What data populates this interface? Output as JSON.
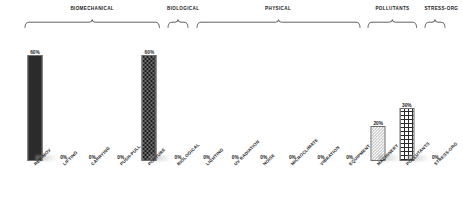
{
  "chart_data": {
    "type": "bar",
    "title": "",
    "subtitle": "",
    "xlabel": "",
    "ylabel": "",
    "ylim": [
      0,
      65
    ],
    "grid": false,
    "legend": "none",
    "value_suffix": "%",
    "categories": [
      "REP-MOV",
      "LIFTING",
      "CARRYING",
      "PUSH-PULL",
      "POSTURE",
      "BIOLOGICAL",
      "LIGHTING",
      "UV RADIATION",
      "NOISE",
      "MICROCLIMATE",
      "VIBRATION",
      "EQUIPMENT",
      "MACHINERY",
      "POLLUTANTS",
      "STRESS-ORG"
    ],
    "values": [
      60,
      0,
      0,
      0,
      60,
      0,
      0,
      0,
      0,
      0,
      0,
      0,
      20,
      30,
      0
    ],
    "value_labels": [
      "60%",
      "0%",
      "0%",
      "0%",
      "60%",
      "0%",
      "0%",
      "0%",
      "0%",
      "0%",
      "0%",
      "0%",
      "20%",
      "30%",
      "0%"
    ],
    "bar_patterns": [
      "solid",
      "none",
      "none",
      "none",
      "dots",
      "none",
      "none",
      "none",
      "none",
      "none",
      "none",
      "none",
      "checker",
      "cross",
      "none"
    ],
    "groups": [
      {
        "label": "BIOMECHANICAL",
        "start": 0,
        "end": 4
      },
      {
        "label": "BIOLOGICAL",
        "start": 5,
        "end": 5
      },
      {
        "label": "PHYSICAL",
        "start": 6,
        "end": 11
      },
      {
        "label": "POLLUTANTS",
        "start": 12,
        "end": 13
      },
      {
        "label": "STRESS-ORG",
        "start": 14,
        "end": 14
      }
    ],
    "colors": {
      "bar_solid": "#2b2b2b",
      "bar_dots": "#6d6d6d",
      "bar_checker": "#bbbbbb",
      "bar_cross": "#2a2a2a",
      "text": "#1d1d1d",
      "background": "#ffffff"
    }
  }
}
